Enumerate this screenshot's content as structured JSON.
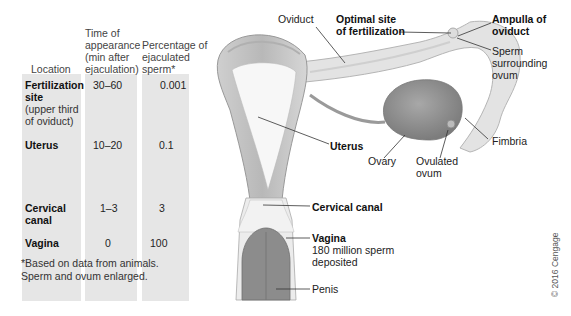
{
  "table": {
    "headers": {
      "location": "Location",
      "time": [
        "Time of",
        "appearance",
        "(min after",
        "ejaculation)"
      ],
      "percent": [
        "Percentage of",
        "ejaculated",
        "sperm*"
      ]
    },
    "rows": [
      {
        "location": "Fertilization",
        "location2": "site",
        "sub": [
          "(upper third",
          "of oviduct)"
        ],
        "time": "30–60",
        "percent": "0.001"
      },
      {
        "location": "Uterus",
        "time": "10–20",
        "percent": "0.1"
      },
      {
        "location": "Cervical",
        "location2": "canal",
        "time": "1–3",
        "percent": "3"
      },
      {
        "location": "Vagina",
        "time": "0",
        "percent": "100"
      }
    ],
    "footnote": [
      "*Based on data from animals.",
      "Sperm and ovum enlarged."
    ]
  },
  "labels": {
    "oviduct": "Oviduct",
    "optimal_site": [
      "Optimal site",
      "of fertilization"
    ],
    "ampulla": [
      "Ampulla of",
      "oviduct"
    ],
    "sperm_surrounding": [
      "Sperm",
      "surrounding",
      "ovum"
    ],
    "uterus": "Uterus",
    "ovary": "Ovary",
    "ovulated_ovum": [
      "Ovulated",
      "ovum"
    ],
    "fimbria": "Fimbria",
    "cervical_canal": "Cervical canal",
    "vagina": "Vagina",
    "vagina_note": [
      "180 million sperm",
      "deposited"
    ],
    "penis": "Penis"
  },
  "copyright": "© 2016 Cengage",
  "colors": {
    "table_bg": "#e6e6e6",
    "tissue_light": "#e8e8e8",
    "tissue_mid": "#c8c8c8",
    "tissue_dark": "#9a9a9a",
    "ovary": "#8f8f8f"
  }
}
